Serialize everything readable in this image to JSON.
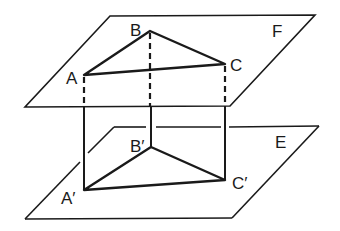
{
  "figure": {
    "planes": [
      {
        "name": "F",
        "label": "F"
      },
      {
        "name": "E",
        "label": "E"
      }
    ],
    "vertices": {
      "A": "A",
      "B": "B",
      "C": "C",
      "A_prime": "A′",
      "B_prime": "B′",
      "C_prime": "C′"
    },
    "colors": {
      "line": "#1a1a1a",
      "background": "#ffffff"
    }
  }
}
